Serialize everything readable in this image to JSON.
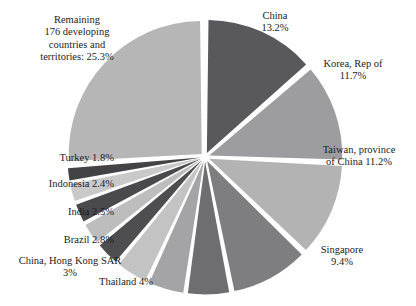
{
  "chart_data": {
    "type": "pie",
    "title": "",
    "subtitle": "",
    "xlabel": "",
    "ylabel": "",
    "legend_position": "none",
    "grid": false,
    "start_angle_deg": 0,
    "direction": "clockwise",
    "exploded": true,
    "unit": "%",
    "categories": [
      "China",
      "Korea, Rep of",
      "Taiwan, province of China",
      "Singapore",
      "Unlabeled slice 1",
      "Unlabeled slice 2",
      "Thailand",
      "China, Hong Kong SAR",
      "Brazil",
      "India",
      "Indonesia",
      "Turkey",
      "Remaining 176 developing countries and territories"
    ],
    "values": [
      13.2,
      11.7,
      11.2,
      9.4,
      5.2,
      4.5,
      4.0,
      3.0,
      2.8,
      2.5,
      2.4,
      1.8,
      25.3
    ],
    "colors": [
      "#59595b",
      "#9d9d9f",
      "#b3b3b4",
      "#7e7e80",
      "#6e6e70",
      "#a4a4a6",
      "#c3c3c4",
      "#4e4e50",
      "#bdbdbe",
      "#4a4a4c",
      "#c9c9ca",
      "#434345",
      "#b6b6b7"
    ],
    "slices": [
      {
        "name": "China",
        "value": 13.2,
        "color": "#59595b",
        "labeled": true
      },
      {
        "name": "Korea, Rep of",
        "value": 11.7,
        "color": "#9d9d9f",
        "labeled": true
      },
      {
        "name": "Taiwan, province of China",
        "value": 11.2,
        "color": "#b3b3b4",
        "labeled": true
      },
      {
        "name": "Singapore",
        "value": 9.4,
        "color": "#7e7e80",
        "labeled": true
      },
      {
        "name": "Unlabeled slice 1",
        "value": 5.2,
        "color": "#6e6e70",
        "labeled": false
      },
      {
        "name": "Unlabeled slice 2",
        "value": 4.5,
        "color": "#a4a4a6",
        "labeled": false
      },
      {
        "name": "Thailand",
        "value": 4.0,
        "color": "#c3c3c4",
        "labeled": true
      },
      {
        "name": "China, Hong Kong SAR",
        "value": 3.0,
        "color": "#4e4e50",
        "labeled": true
      },
      {
        "name": "Brazil",
        "value": 2.8,
        "color": "#bdbdbe",
        "labeled": true
      },
      {
        "name": "India",
        "value": 2.5,
        "color": "#4a4a4c",
        "labeled": true
      },
      {
        "name": "Indonesia",
        "value": 2.4,
        "color": "#c9c9ca",
        "labeled": true
      },
      {
        "name": "Turkey",
        "value": 1.8,
        "color": "#434345",
        "labeled": true
      },
      {
        "name": "Remaining 176 developing countries and territories",
        "value": 25.3,
        "color": "#b6b6b7",
        "labeled": true
      }
    ]
  },
  "labels": {
    "remaining": "Remaining\n176 developing\ncountries and\nterritories: 25.3%",
    "china": "China\n13.2%",
    "korea": "Korea, Rep of\n11.7%",
    "taiwan": "Taiwan, province\nof China 11.2%",
    "singapore": "Singapore\n9.4%",
    "thailand": "Thailand 4%",
    "hongkong": "China, Hong Kong SAR\n3%",
    "brazil": "Brazil 2.8%",
    "india": "India 2.5%",
    "indonesia": "Indonesia 2.4%",
    "turkey": "Turkey 1.8%"
  },
  "geometry": {
    "center_x": 205,
    "center_y": 157,
    "radius": 133,
    "explode_offset": 4.5,
    "background": "#ffffff"
  }
}
